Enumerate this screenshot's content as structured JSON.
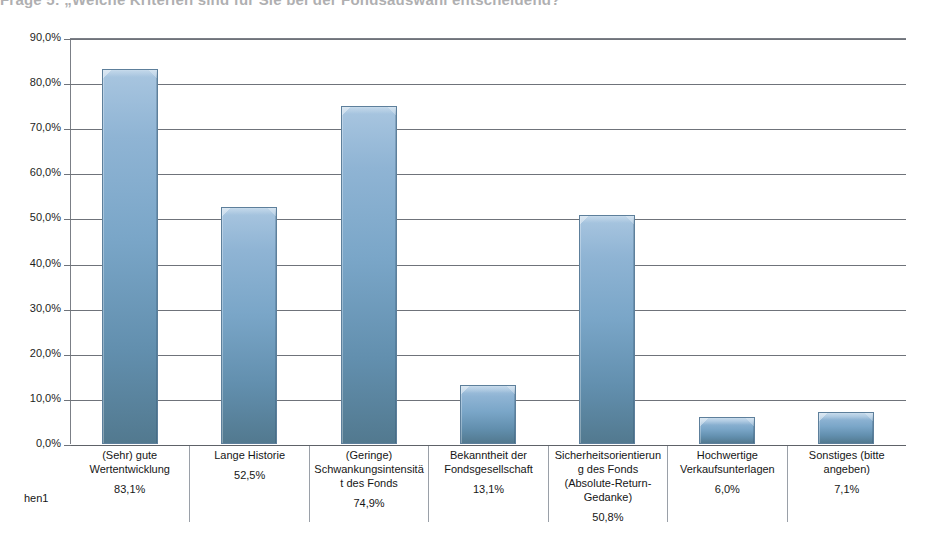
{
  "title_remnant": "Frage 5: „Welche Kriterien sind für Sie bei der Fondsauswahl entscheidend?\"",
  "series_label": "hen1",
  "chart_data": {
    "type": "bar",
    "title": "",
    "xlabel": "",
    "ylabel": "",
    "ylim": [
      0,
      90
    ],
    "grid": true,
    "legend": "none",
    "ytick_labels": [
      "90,0%",
      "80,0%",
      "70,0%",
      "60,0%",
      "50,0%",
      "40,0%",
      "30,0%",
      "20,0%",
      "10,0%",
      "0,0%"
    ],
    "ytick_values": [
      90,
      80,
      70,
      60,
      50,
      40,
      30,
      20,
      10,
      0
    ],
    "categories": [
      "(Sehr) gute Wertentwicklung",
      "Lange Historie",
      "(Geringe) Schwankungsintensität des Fonds",
      "Bekanntheit der Fondsgesellschaft",
      "Sicherheitsorientierung des Fonds (Absolute-Return-Gedanke)",
      "Hochwertige Verkaufsunterlagen",
      "Sonstiges (bitte angeben)"
    ],
    "values": [
      83.1,
      52.5,
      74.9,
      13.1,
      50.8,
      6.0,
      7.1
    ],
    "value_labels": [
      "83,1%",
      "52,5%",
      "74,9%",
      "13,1%",
      "50,8%",
      "6,0%",
      "7,1%"
    ],
    "series": [
      {
        "name": "hen1",
        "values": [
          83.1,
          52.5,
          74.9,
          13.1,
          50.8,
          6.0,
          7.1
        ]
      }
    ],
    "bar_color": "#7aa6c8",
    "bar_border_color": "#5d7f9b",
    "gridline_color": "#6f737a"
  }
}
